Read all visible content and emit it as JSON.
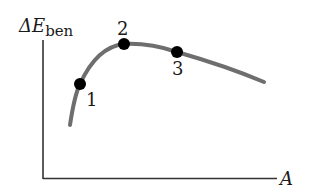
{
  "diagram": {
    "y_axis_label": {
      "main": "ΔE",
      "subscript": "ben"
    },
    "x_axis_label": "A",
    "points": [
      {
        "label": "1"
      },
      {
        "label": "2"
      },
      {
        "label": "3"
      }
    ],
    "colors": {
      "axis": "#333333",
      "curve": "#6e6e6e",
      "point": "#000000",
      "text": "#1a1a1a"
    }
  }
}
